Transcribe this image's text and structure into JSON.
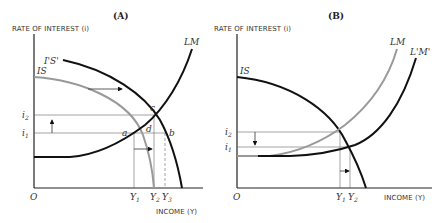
{
  "panel_a": {
    "title": "(A)",
    "y_axis_label": "RATE OF INTEREST (i)",
    "x_axis_label": "INCOME (Y)",
    "origin": "O",
    "curves": {
      "is": "IS",
      "is_shifted": "I'S'",
      "lm": "LM"
    },
    "points": {
      "a": "a",
      "b": "b",
      "c": "c",
      "d": "d"
    },
    "y_ticks": {
      "i2": "i",
      "i2_sub": "2",
      "i1": "i",
      "i1_sub": "1"
    },
    "x_ticks": {
      "y1": "Y",
      "y1_sub": "1",
      "y2": "Y",
      "y2_sub": "2",
      "y3": "Y",
      "y3_sub": "3"
    }
  },
  "panel_b": {
    "title": "(B)",
    "y_axis_label": "RATE OF INTEREST (i)",
    "x_axis_label": "INCOME (Y)",
    "origin": "O",
    "curves": {
      "is": "IS",
      "lm": "LM",
      "lm_shifted": "L'M'"
    },
    "y_ticks": {
      "i2": "i",
      "i2_sub": "2",
      "i1": "i",
      "i1_sub": "1"
    },
    "x_ticks": {
      "y1": "Y",
      "y1_sub": "1",
      "y2": "Y",
      "y2_sub": "2"
    }
  },
  "colors": {
    "black_curve": "#111111",
    "gray_curve": "#999999",
    "guide": "#666666"
  }
}
